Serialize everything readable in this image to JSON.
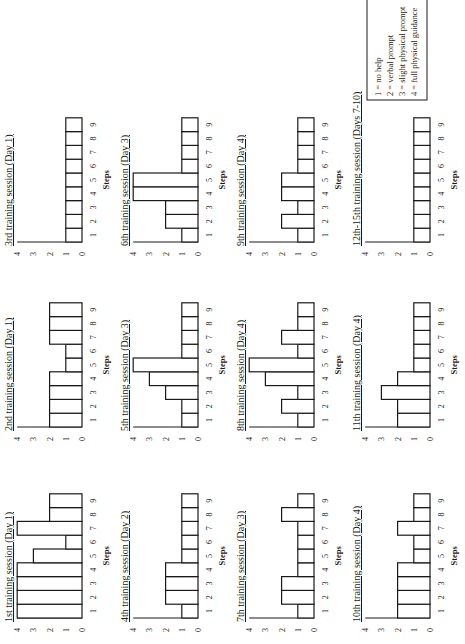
{
  "figure": {
    "orientation": "rotated 90 degrees counter-clockwise",
    "legend": {
      "items": [
        "1 = no help",
        "2 = verbal prompt",
        "3 = slight physical prompt",
        "4 = full physical guidance"
      ]
    }
  },
  "chart_data": [
    {
      "type": "bar",
      "title": "1st training session (Day 1)",
      "xlabel": "Steps",
      "ylabel": "",
      "categories": [
        "1",
        "2",
        "3",
        "4",
        "5",
        "6",
        "7",
        "8",
        "9"
      ],
      "values": [
        4,
        4,
        4,
        4,
        3,
        1,
        4,
        2,
        2
      ],
      "yticks": [
        "0",
        "1",
        "2",
        "3",
        "4"
      ],
      "ylim": [
        0,
        4
      ]
    },
    {
      "type": "bar",
      "title": "2nd training session (Day 1)",
      "xlabel": "Steps",
      "ylabel": "",
      "categories": [
        "1",
        "2",
        "3",
        "4",
        "5",
        "6",
        "7",
        "8",
        "9"
      ],
      "values": [
        2,
        2,
        2,
        2,
        1,
        1,
        2,
        2,
        2
      ],
      "yticks": [
        "0",
        "1",
        "2",
        "3",
        "4"
      ],
      "ylim": [
        0,
        4
      ]
    },
    {
      "type": "bar",
      "title": "3rd training session (Day 1)",
      "xlabel": "Steps",
      "ylabel": "",
      "categories": [
        "1",
        "2",
        "3",
        "4",
        "5",
        "6",
        "7",
        "8",
        "9"
      ],
      "values": [
        1,
        1,
        1,
        1,
        1,
        1,
        1,
        1,
        1
      ],
      "yticks": [
        "0",
        "1",
        "2",
        "3",
        "4"
      ],
      "ylim": [
        0,
        4
      ]
    },
    {
      "type": "bar",
      "title": "4th training session (Day 2)",
      "xlabel": "Steps",
      "ylabel": "",
      "categories": [
        "1",
        "2",
        "3",
        "4",
        "5",
        "6",
        "7",
        "8",
        "9"
      ],
      "values": [
        1,
        2,
        2,
        2,
        1,
        1,
        1,
        1,
        1
      ],
      "yticks": [
        "0",
        "1",
        "2",
        "3",
        "4"
      ],
      "ylim": [
        0,
        4
      ]
    },
    {
      "type": "bar",
      "title": "5th training session (Day 3)",
      "xlabel": "Steps",
      "ylabel": "",
      "categories": [
        "1",
        "2",
        "3",
        "4",
        "5",
        "6",
        "7",
        "8",
        "9"
      ],
      "values": [
        1,
        1,
        2,
        3,
        4,
        1,
        1,
        1,
        1
      ],
      "yticks": [
        "0",
        "1",
        "2",
        "3",
        "4"
      ],
      "ylim": [
        0,
        4
      ]
    },
    {
      "type": "bar",
      "title": "6th training session (Day 3)",
      "xlabel": "Steps",
      "ylabel": "",
      "categories": [
        "1",
        "2",
        "3",
        "4",
        "5",
        "6",
        "7",
        "8",
        "9"
      ],
      "values": [
        1,
        2,
        2,
        4,
        4,
        1,
        1,
        1,
        1
      ],
      "yticks": [
        "0",
        "1",
        "2",
        "3",
        "4"
      ],
      "ylim": [
        0,
        4
      ]
    },
    {
      "type": "bar",
      "title": "7th training session (Day 3)",
      "xlabel": "Steps",
      "ylabel": "",
      "categories": [
        "1",
        "2",
        "3",
        "4",
        "5",
        "6",
        "7",
        "8",
        "9"
      ],
      "values": [
        1,
        2,
        2,
        1,
        1,
        1,
        1,
        2,
        1
      ],
      "yticks": [
        "0",
        "1",
        "2",
        "3",
        "4"
      ],
      "ylim": [
        0,
        4
      ]
    },
    {
      "type": "bar",
      "title": "8th training session (Day 4)",
      "xlabel": "Steps",
      "ylabel": "",
      "categories": [
        "1",
        "2",
        "3",
        "4",
        "5",
        "6",
        "7",
        "8",
        "9"
      ],
      "values": [
        1,
        2,
        1,
        3,
        4,
        1,
        2,
        1,
        1
      ],
      "yticks": [
        "0",
        "1",
        "2",
        "3",
        "4"
      ],
      "ylim": [
        0,
        4
      ]
    },
    {
      "type": "bar",
      "title": "9th training session (Day 4)",
      "xlabel": "Steps",
      "ylabel": "",
      "categories": [
        "1",
        "2",
        "3",
        "4",
        "5",
        "6",
        "7",
        "8",
        "9"
      ],
      "values": [
        1,
        2,
        1,
        2,
        2,
        1,
        1,
        1,
        1
      ],
      "yticks": [
        "0",
        "1",
        "2",
        "3",
        "4"
      ],
      "ylim": [
        0,
        4
      ]
    },
    {
      "type": "bar",
      "title": "10th training session (Day 4)",
      "xlabel": "Steps",
      "ylabel": "",
      "categories": [
        "1",
        "2",
        "3",
        "4",
        "5",
        "6",
        "7",
        "8",
        "9"
      ],
      "values": [
        2,
        2,
        2,
        2,
        1,
        1,
        2,
        1,
        1
      ],
      "yticks": [
        "0",
        "1",
        "2",
        "3",
        "4"
      ],
      "ylim": [
        0,
        4
      ]
    },
    {
      "type": "bar",
      "title": "11th training session (Day 4)",
      "xlabel": "Steps",
      "ylabel": "",
      "categories": [
        "1",
        "2",
        "3",
        "4",
        "5",
        "6",
        "7",
        "8",
        "9"
      ],
      "values": [
        2,
        2,
        3,
        2,
        1,
        1,
        1,
        1,
        1
      ],
      "yticks": [
        "0",
        "1",
        "2",
        "3",
        "4"
      ],
      "ylim": [
        0,
        4
      ]
    },
    {
      "type": "bar",
      "title": "12th-15th training session (Days 7-10)",
      "xlabel": "Steps",
      "ylabel": "",
      "categories": [
        "1",
        "2",
        "3",
        "4",
        "5",
        "6",
        "7",
        "8",
        "9"
      ],
      "values": [
        1,
        1,
        1,
        1,
        1,
        1,
        1,
        1,
        1
      ],
      "yticks": [
        "0",
        "1",
        "2",
        "3",
        "4"
      ],
      "ylim": [
        0,
        4
      ]
    }
  ]
}
